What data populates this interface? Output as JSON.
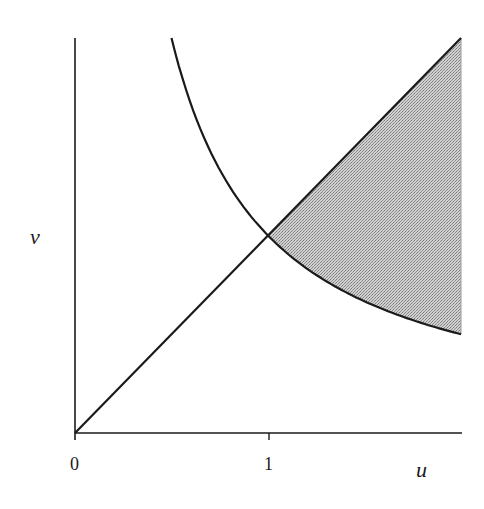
{
  "figure": {
    "axes": {
      "x_label": "u",
      "y_label": "v",
      "x_ticks": [
        {
          "value": 0,
          "label": "0"
        },
        {
          "value": 1,
          "label": "1"
        }
      ],
      "x_range": [
        0,
        2
      ],
      "y_range": [
        0,
        2
      ]
    },
    "curves": [
      {
        "name": "line",
        "equation": "v = u"
      },
      {
        "name": "hyperbola",
        "equation": "v = 1/u"
      }
    ],
    "shaded_region": {
      "description": "region between v = u (above) and v = 1/u (below), for 1 <= u <= 2",
      "fill": "#b8b8b8"
    },
    "colors": {
      "stroke": "#1a1a1a",
      "background": "#ffffff",
      "shade": "#b8b8b8"
    }
  }
}
